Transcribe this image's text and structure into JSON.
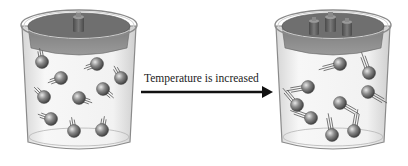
{
  "diagram": {
    "arrow_label": "Temperature is increased",
    "colors": {
      "background": "#ffffff",
      "beaker_glass": "#eeeeee",
      "beaker_outline": "#8a8a8a",
      "piston_top": "#6f6f6f",
      "piston_side": "#8d8d8d",
      "weight": "#5a5a5a",
      "molecule": "#7a7a7a",
      "arrow": "#111111",
      "text": "#222222"
    },
    "left_beaker": {
      "name": "before",
      "weights_count": 1,
      "molecule_count": 11,
      "molecules": [
        {
          "x": 42,
          "y": 62,
          "tail_angle": -100
        },
        {
          "x": 97,
          "y": 64,
          "tail_angle": 160
        },
        {
          "x": 121,
          "y": 78,
          "tail_angle": -120
        },
        {
          "x": 61,
          "y": 78,
          "tail_angle": 160
        },
        {
          "x": 44,
          "y": 97,
          "tail_angle": -135
        },
        {
          "x": 79,
          "y": 98,
          "tail_angle": 20
        },
        {
          "x": 103,
          "y": 89,
          "tail_angle": 40
        },
        {
          "x": 51,
          "y": 119,
          "tail_angle": 200
        },
        {
          "x": 74,
          "y": 131,
          "tail_angle": -100
        },
        {
          "x": 102,
          "y": 130,
          "tail_angle": -80
        }
      ]
    },
    "right_beaker": {
      "name": "after",
      "weights_count": 3,
      "molecule_count": 12,
      "molecules": [
        {
          "x": 340,
          "y": 64,
          "tail_angle": 165
        },
        {
          "x": 369,
          "y": 73,
          "tail_angle": -110
        },
        {
          "x": 308,
          "y": 87,
          "tail_angle": 170
        },
        {
          "x": 368,
          "y": 92,
          "tail_angle": 30
        },
        {
          "x": 297,
          "y": 105,
          "tail_angle": -130
        },
        {
          "x": 340,
          "y": 103,
          "tail_angle": 30
        },
        {
          "x": 311,
          "y": 118,
          "tail_angle": 200
        },
        {
          "x": 332,
          "y": 135,
          "tail_angle": -100
        },
        {
          "x": 354,
          "y": 131,
          "tail_angle": -80
        }
      ]
    }
  }
}
